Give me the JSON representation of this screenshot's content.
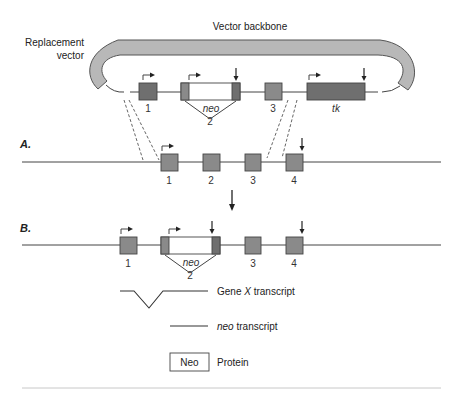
{
  "vector": {
    "backbone_label": "Vector backbone",
    "replacement_label_line1": "Replacement",
    "replacement_label_line2": "vector",
    "exon_labels": [
      "1",
      "2",
      "3"
    ],
    "neo_label": "neo",
    "tk_label": "tk"
  },
  "panel_a": {
    "label": "A.",
    "exon_labels": [
      "1",
      "2",
      "3",
      "4"
    ]
  },
  "panel_b": {
    "label": "B.",
    "exon_labels": [
      "1",
      "2",
      "3",
      "4"
    ],
    "neo_label": "neo"
  },
  "legend": {
    "gene_x_prefix": "Gene ",
    "gene_x_italic": "X",
    "gene_x_suffix": " transcript",
    "neo_transcript_italic": "neo",
    "neo_transcript_suffix": " transcript",
    "neo_box_label": "Neo",
    "protein_label": "Protein"
  },
  "colors": {
    "backbone_fill": "#b8b8b8",
    "exon_fill": "#8a8a8a",
    "tk_fill": "#6f6f6f",
    "line": "#444444"
  }
}
